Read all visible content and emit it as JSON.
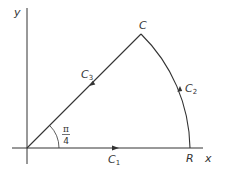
{
  "diagram": {
    "axes": {
      "x_label": "x",
      "y_label": "y"
    },
    "points": {
      "C": "C",
      "R": "R"
    },
    "curves": {
      "C1": {
        "base": "C",
        "sub": "1"
      },
      "C2": {
        "base": "C",
        "sub": "2"
      },
      "C3": {
        "base": "C",
        "sub": "3"
      }
    },
    "angle": {
      "numerator": "π",
      "denominator": "4"
    },
    "colors": {
      "stroke": "#333333"
    }
  }
}
